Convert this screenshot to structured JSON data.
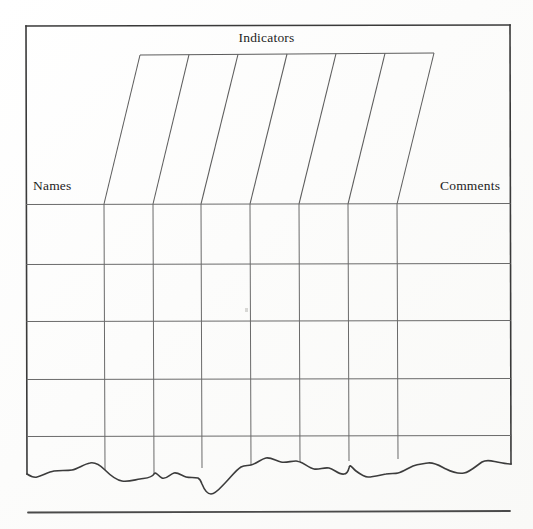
{
  "document": {
    "kind": "scanned-form-table",
    "background_color": "#fdfdfc",
    "ink_color": "#2b2b2b",
    "rule_color": "#5a5a5a"
  },
  "form": {
    "title": "Indicators",
    "left_header": "Names",
    "right_header": "Comments"
  },
  "table": {
    "column_count": 6,
    "row_count": 5,
    "frame": {
      "left": 26,
      "top": 26,
      "right": 510,
      "header_baseline": 204
    },
    "slanted_header": {
      "top_y": 55,
      "bottom_y": 204,
      "top_x": [
        140,
        189,
        238,
        287,
        336,
        385,
        434
      ],
      "bottom_x": [
        104,
        153,
        201,
        250,
        299,
        348,
        397
      ]
    },
    "row_line_y": [
      204,
      264,
      321,
      379,
      436
    ],
    "column_line_x": [
      104,
      153,
      201,
      250,
      299,
      348,
      397
    ],
    "cells": [
      [
        "",
        "",
        "",
        "",
        "",
        "",
        "",
        ""
      ],
      [
        "",
        "",
        "",
        "",
        "",
        "",
        "",
        ""
      ],
      [
        "",
        "",
        "",
        "",
        "",
        "",
        "",
        ""
      ],
      [
        "",
        "",
        "",
        "",
        "",
        "",
        "",
        ""
      ],
      [
        "",
        "",
        "",
        "",
        "",
        "",
        "",
        ""
      ]
    ]
  },
  "torn_edge": {
    "description": "wavy torn lower edge of paper",
    "start_x": 28,
    "end_x": 510,
    "baseline_y": 470
  },
  "footer_rule": {
    "left": 28,
    "right": 510,
    "y": 512
  },
  "marks": [
    {
      "name": "ink-speck",
      "x": 245,
      "y": 308
    }
  ]
}
